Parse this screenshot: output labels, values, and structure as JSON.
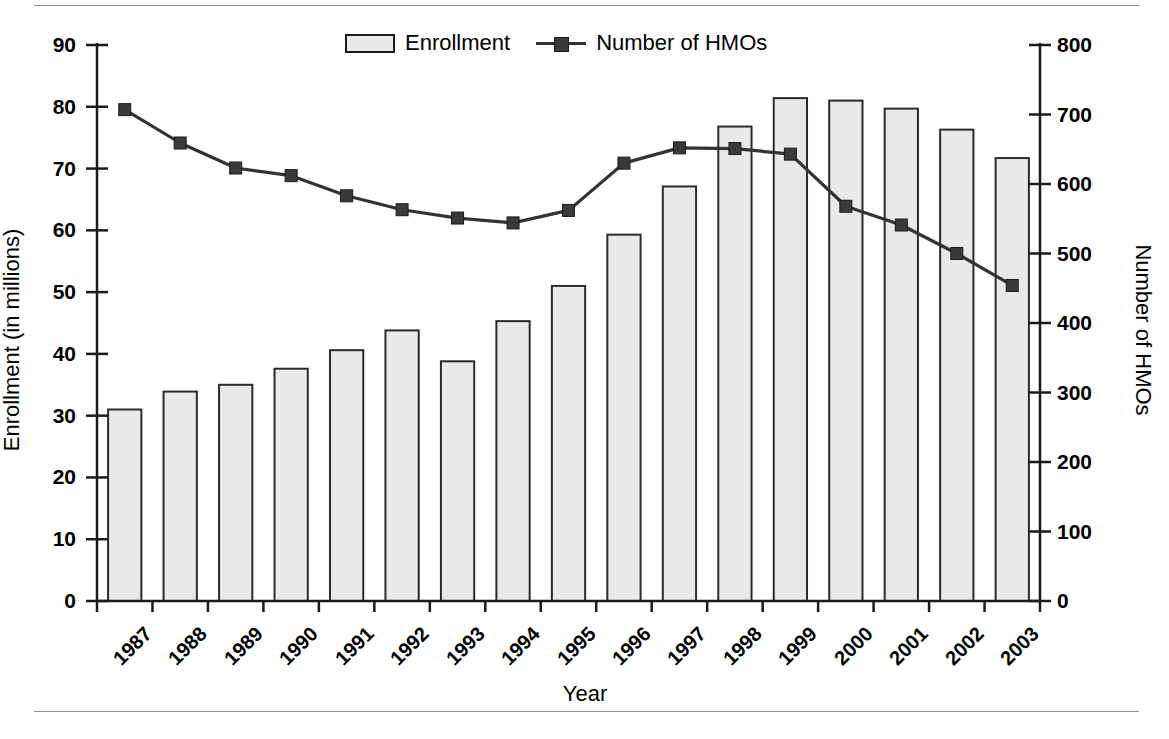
{
  "chart_data": {
    "type": "bar",
    "title": "",
    "xlabel": "Year",
    "ylabel": "Enrollment (in millions)",
    "ylabel_right": "Number of HMOs",
    "categories": [
      "1987",
      "1988",
      "1989",
      "1990",
      "1991",
      "1992",
      "1993",
      "1994",
      "1995",
      "1996",
      "1997",
      "1998",
      "1999",
      "2000",
      "2001",
      "2002",
      "2003"
    ],
    "ylim": [
      0,
      90
    ],
    "ylim_right": [
      0,
      800
    ],
    "yticks": [
      "0",
      "10",
      "20",
      "30",
      "40",
      "50",
      "60",
      "70",
      "80",
      "90"
    ],
    "yticks_right": [
      "0",
      "100",
      "200",
      "300",
      "400",
      "500",
      "600",
      "700",
      "800"
    ],
    "grid": false,
    "legend_position": "top-center",
    "series": [
      {
        "name": "Enrollment",
        "kind": "bar",
        "axis": "left",
        "unit": "millions",
        "values": [
          31.0,
          33.9,
          35.0,
          37.6,
          40.6,
          43.8,
          38.8,
          45.3,
          51.0,
          59.3,
          67.1,
          76.8,
          81.4,
          81.0,
          79.7,
          76.3,
          71.7
        ]
      },
      {
        "name": "Number of HMOs",
        "kind": "line",
        "axis": "right",
        "unit": "count",
        "values": [
          707,
          659,
          623,
          612,
          583,
          563,
          551,
          544,
          562,
          630,
          652,
          651,
          643,
          568,
          541,
          500,
          454
        ]
      }
    ]
  },
  "legend": {
    "entries": [
      {
        "label": "Enrollment",
        "marker": "filled-rect-swatch",
        "color": "#e9e9e9"
      },
      {
        "label": "Number of HMOs",
        "marker": "line-square-marker",
        "color": "#333333"
      }
    ]
  },
  "colors": {
    "bar_fill": "#e9e9e9",
    "bar_stroke": "#2b2b2b",
    "line": "#333333",
    "marker": "#3a3a3a",
    "axis": "#1a1a1a",
    "rule": "#8c8c8c",
    "background": "#ffffff"
  }
}
